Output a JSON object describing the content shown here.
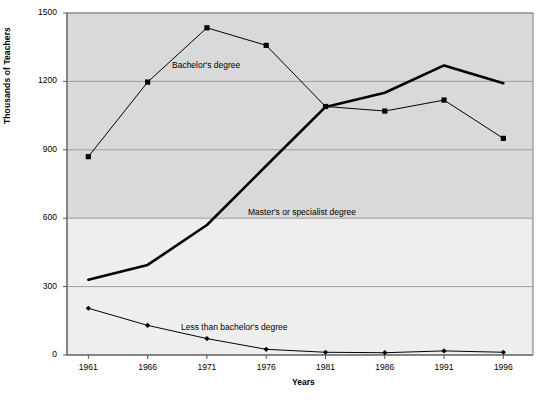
{
  "chart_data": {
    "type": "line",
    "title": "",
    "xlabel": "Years",
    "ylabel": "Thousands of Teachers",
    "categories": [
      "1961",
      "1966",
      "1971",
      "1976",
      "1981",
      "1986",
      "1991",
      "1996"
    ],
    "x": [
      1961,
      1966,
      1971,
      1976,
      1981,
      1986,
      1991,
      1996
    ],
    "xlim": [
      1959.2,
      1998.5
    ],
    "ylim": [
      0,
      1500
    ],
    "yticks": [
      0,
      300,
      600,
      900,
      1200,
      1500
    ],
    "ytick_labels": [
      "0",
      "300",
      "600",
      "900",
      "1200",
      "1500"
    ],
    "grid": true,
    "grid_axis": "y",
    "legend": "inline-annotations",
    "plot_bg": "#d9d9d9",
    "series": [
      {
        "name": "Bachelor's degree",
        "label": "Bachelor's degree",
        "color": "#000000",
        "marker": "square",
        "line_width": 1,
        "values": [
          870,
          1197,
          1435,
          1358,
          1090,
          1070,
          1118,
          950
        ]
      },
      {
        "name": "Master's or specialist degree",
        "label": "Master's or specialist degree",
        "color": "#000000",
        "marker": "none",
        "line_width": 2.6,
        "values": [
          330,
          395,
          570,
          830,
          1088,
          1150,
          1270,
          1192
        ]
      },
      {
        "name": "Less than bachelor's degree",
        "label": "Less than bachelor's degree",
        "color": "#000000",
        "marker": "diamond",
        "line_width": 1,
        "values": [
          205,
          130,
          72,
          25,
          12,
          10,
          18,
          12
        ]
      }
    ],
    "annotations": [
      {
        "text": "Bachelor's degree",
        "x_px": 172,
        "y_px": 60
      },
      {
        "text": "Master's or specialist degree",
        "x_px": 248,
        "y_px": 207
      },
      {
        "text": "Less than bachelor's degree",
        "x_px": 181,
        "y_px": 322
      }
    ]
  }
}
